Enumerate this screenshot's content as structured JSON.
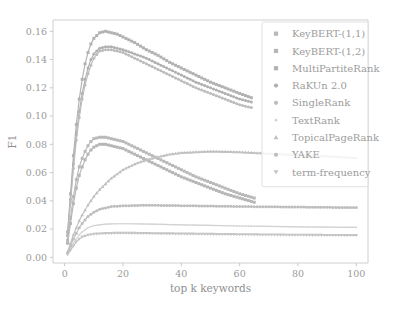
{
  "figure": {
    "background": "#ffffff",
    "plot_background": "#ffffff",
    "axis_color": "#c9c9c9",
    "text_color": "#9a9a9a"
  },
  "chart_data": {
    "type": "line",
    "title": "",
    "xlabel": "top k keywords",
    "ylabel": "F1",
    "xlim": [
      -4,
      104
    ],
    "ylim": [
      -0.004,
      0.168
    ],
    "grid": false,
    "legend_position": "upper right",
    "xticks": [
      0,
      20,
      40,
      60,
      80,
      100
    ],
    "xticklabels": [
      "0",
      "20",
      "40",
      "60",
      "80",
      "100"
    ],
    "yticks": [
      0.0,
      0.02,
      0.04,
      0.06,
      0.08,
      0.1,
      0.12,
      0.14,
      0.16
    ],
    "yticklabels": [
      "0.00",
      "0.02",
      "0.04",
      "0.06",
      "0.08",
      "0.10",
      "0.12",
      "0.14",
      "0.16"
    ],
    "markers": [
      "square",
      "square",
      "square",
      "circle",
      "circle",
      "dot",
      "triangle-up",
      "circle",
      "triangle-down"
    ],
    "series": [
      {
        "name": "KeyBERT-(1,1)",
        "color": "#b9b9b9",
        "marker": "square",
        "x": [
          1,
          2,
          3,
          4,
          5,
          6,
          7,
          8,
          9,
          10,
          12,
          14,
          16,
          18,
          20,
          24,
          28,
          32,
          36,
          40,
          45,
          50,
          55,
          60,
          65
        ],
        "y": [
          0.012,
          0.028,
          0.043,
          0.055,
          0.064,
          0.07,
          0.075,
          0.079,
          0.082,
          0.084,
          0.085,
          0.085,
          0.084,
          0.083,
          0.082,
          0.078,
          0.074,
          0.07,
          0.066,
          0.062,
          0.057,
          0.053,
          0.049,
          0.045,
          0.042
        ]
      },
      {
        "name": "KeyBERT-(1,2)",
        "color": "#b6b6b6",
        "marker": "square",
        "x": [
          1,
          2,
          3,
          4,
          5,
          6,
          7,
          8,
          9,
          10,
          12,
          14,
          16,
          18,
          20,
          24,
          28,
          32,
          36,
          40,
          45,
          50,
          55,
          60,
          65
        ],
        "y": [
          0.01,
          0.024,
          0.038,
          0.049,
          0.058,
          0.064,
          0.069,
          0.073,
          0.076,
          0.078,
          0.08,
          0.08,
          0.079,
          0.078,
          0.077,
          0.073,
          0.069,
          0.065,
          0.061,
          0.057,
          0.053,
          0.049,
          0.045,
          0.042,
          0.039
        ]
      },
      {
        "name": "MultiPartiteRank",
        "color": "#b2b2b2",
        "marker": "square",
        "x": [
          1,
          2,
          3,
          4,
          5,
          6,
          7,
          8,
          9,
          10,
          12,
          14,
          16,
          18,
          20,
          24,
          28,
          32,
          36,
          40,
          45,
          50,
          55,
          60,
          64
        ],
        "y": [
          0.018,
          0.045,
          0.072,
          0.094,
          0.112,
          0.126,
          0.137,
          0.145,
          0.151,
          0.155,
          0.159,
          0.16,
          0.159,
          0.158,
          0.156,
          0.152,
          0.147,
          0.143,
          0.138,
          0.134,
          0.129,
          0.124,
          0.12,
          0.116,
          0.113
        ]
      },
      {
        "name": "RaKUn 2.0",
        "color": "#b0b0b0",
        "marker": "circle",
        "x": [
          1,
          2,
          3,
          4,
          5,
          6,
          7,
          8,
          9,
          10,
          12,
          14,
          16,
          18,
          20,
          24,
          28,
          32,
          36,
          40,
          45,
          50,
          55,
          60,
          64
        ],
        "y": [
          0.016,
          0.041,
          0.066,
          0.087,
          0.103,
          0.116,
          0.126,
          0.134,
          0.14,
          0.144,
          0.148,
          0.149,
          0.149,
          0.148,
          0.147,
          0.144,
          0.141,
          0.137,
          0.133,
          0.129,
          0.124,
          0.12,
          0.116,
          0.112,
          0.11
        ]
      },
      {
        "name": "SingleRank",
        "color": "#bcbcbc",
        "marker": "circle",
        "x": [
          1,
          2,
          3,
          4,
          5,
          6,
          7,
          8,
          9,
          10,
          12,
          14,
          16,
          18,
          20,
          24,
          28,
          32,
          36,
          40,
          45,
          50,
          55,
          60,
          64
        ],
        "y": [
          0.015,
          0.039,
          0.063,
          0.083,
          0.099,
          0.112,
          0.122,
          0.13,
          0.136,
          0.141,
          0.146,
          0.147,
          0.147,
          0.146,
          0.145,
          0.141,
          0.137,
          0.133,
          0.129,
          0.125,
          0.12,
          0.116,
          0.112,
          0.108,
          0.106
        ]
      },
      {
        "name": "TextRank",
        "color": "#d2d2d2",
        "marker": "dot",
        "x": [
          1,
          2,
          3,
          4,
          5,
          6,
          8,
          10,
          14,
          18,
          22,
          30,
          40,
          50,
          60,
          70,
          80,
          90,
          100
        ],
        "y": [
          0.002,
          0.006,
          0.01,
          0.013,
          0.016,
          0.018,
          0.021,
          0.0225,
          0.0235,
          0.0238,
          0.0238,
          0.0235,
          0.023,
          0.0226,
          0.0222,
          0.0219,
          0.0216,
          0.0214,
          0.0212
        ]
      },
      {
        "name": "TopicalPageRank",
        "color": "#c0c0c0",
        "marker": "triangle-up",
        "x": [
          1,
          2,
          3,
          4,
          5,
          6,
          8,
          10,
          12,
          14,
          16,
          18,
          20,
          24,
          28,
          32,
          36,
          40,
          45,
          50,
          55,
          60,
          65,
          70,
          75,
          80,
          85,
          90,
          95,
          100
        ],
        "y": [
          0.004,
          0.01,
          0.016,
          0.021,
          0.026,
          0.03,
          0.037,
          0.043,
          0.048,
          0.052,
          0.056,
          0.059,
          0.062,
          0.066,
          0.069,
          0.071,
          0.073,
          0.074,
          0.0745,
          0.075,
          0.0748,
          0.0745,
          0.074,
          0.0735,
          0.073,
          0.0725,
          0.072,
          0.0715,
          0.071,
          0.0705
        ]
      },
      {
        "name": "YAKE",
        "color": "#bdbdbd",
        "marker": "circle",
        "x": [
          1,
          2,
          3,
          4,
          5,
          6,
          8,
          10,
          12,
          16,
          20,
          26,
          32,
          40,
          50,
          60,
          70,
          80,
          90,
          100
        ],
        "y": [
          0.003,
          0.008,
          0.013,
          0.017,
          0.021,
          0.024,
          0.029,
          0.032,
          0.034,
          0.036,
          0.0365,
          0.0368,
          0.0368,
          0.0366,
          0.0363,
          0.036,
          0.0358,
          0.0356,
          0.0354,
          0.0352
        ]
      },
      {
        "name": "term-frequency",
        "color": "#c4c4c4",
        "marker": "triangle-down",
        "x": [
          1,
          2,
          3,
          4,
          5,
          6,
          8,
          10,
          14,
          18,
          22,
          28,
          36,
          44,
          52,
          60,
          70,
          80,
          90,
          100
        ],
        "y": [
          0.002,
          0.005,
          0.008,
          0.011,
          0.013,
          0.0145,
          0.0158,
          0.0165,
          0.017,
          0.0172,
          0.0172,
          0.017,
          0.0168,
          0.0166,
          0.0164,
          0.0162,
          0.016,
          0.0158,
          0.0157,
          0.0156
        ]
      }
    ]
  },
  "legend": {
    "items": [
      {
        "label": "KeyBERT-(1,1)",
        "marker": "square",
        "color": "#b9b9b9"
      },
      {
        "label": "KeyBERT-(1,2)",
        "marker": "square",
        "color": "#b6b6b6"
      },
      {
        "label": "MultiPartiteRank",
        "marker": "square",
        "color": "#b2b2b2"
      },
      {
        "label": "RaKUn 2.0",
        "marker": "circle",
        "color": "#b0b0b0"
      },
      {
        "label": "SingleRank",
        "marker": "circle",
        "color": "#bcbcbc"
      },
      {
        "label": "TextRank",
        "marker": "dot",
        "color": "#d2d2d2"
      },
      {
        "label": "TopicalPageRank",
        "marker": "triangle-up",
        "color": "#c0c0c0"
      },
      {
        "label": "YAKE",
        "marker": "circle",
        "color": "#bdbdbd"
      },
      {
        "label": "term-frequency",
        "marker": "triangle-down",
        "color": "#c4c4c4"
      }
    ]
  }
}
